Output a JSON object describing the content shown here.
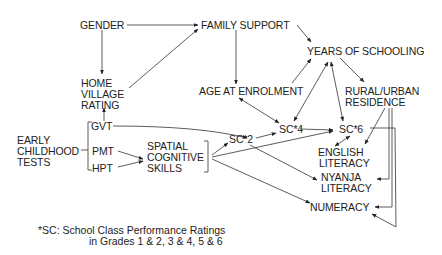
{
  "diagram": {
    "nodes": {
      "gender": [
        "GENDER"
      ],
      "family_support": [
        "FAMILY SUPPORT"
      ],
      "years_of_schooling": [
        "YEARS OF SCHOOLING"
      ],
      "home_village_rating": [
        "HOME",
        "VILLAGE",
        "RATING"
      ],
      "age_at_enrolment": [
        "AGE AT ENROLMENT"
      ],
      "rural_urban_residence": [
        "RURAL/URBAN",
        "RESIDENCE"
      ],
      "early_childhood_tests": [
        "EARLY",
        "CHILDHOOD",
        "TESTS"
      ],
      "gvt": [
        "GVT"
      ],
      "pmt": [
        "PMT"
      ],
      "hpt": [
        "HPT"
      ],
      "spatial_cognitive_skills": [
        "SPATIAL",
        "COGNITIVE",
        "SKILLS"
      ],
      "sc2": [
        "SC*2"
      ],
      "sc4": [
        "SC*4"
      ],
      "sc6": [
        "SC*6"
      ],
      "english_literacy": [
        "ENGLISH",
        "LITERACY"
      ],
      "nyanja_literacy": [
        "NYANJA",
        "LITERACY"
      ],
      "numeracy": [
        "NUMERACY"
      ]
    },
    "edges": [
      {
        "from": "gender",
        "to": "family_support",
        "type": "directed"
      },
      {
        "from": "gender",
        "to": "home_village_rating",
        "type": "directed"
      },
      {
        "from": "home_village_rating",
        "to": "family_support",
        "type": "directed"
      },
      {
        "from": "gvt",
        "to": "home_village_rating",
        "type": "directed"
      },
      {
        "from": "family_support",
        "to": "years_of_schooling",
        "type": "directed"
      },
      {
        "from": "family_support",
        "to": "age_at_enrolment",
        "type": "directed"
      },
      {
        "from": "age_at_enrolment",
        "to": "years_of_schooling",
        "type": "directed"
      },
      {
        "from": "age_at_enrolment",
        "to": "sc4",
        "type": "bidirectional"
      },
      {
        "from": "years_of_schooling",
        "to": "sc4",
        "type": "bidirectional"
      },
      {
        "from": "years_of_schooling",
        "to": "sc6",
        "type": "bidirectional"
      },
      {
        "from": "years_of_schooling",
        "to": "rural_urban_residence",
        "type": "directed"
      },
      {
        "from": "gvt",
        "to": "sc2",
        "type": "directed"
      },
      {
        "from": "pmt",
        "to": "spatial_cognitive_skills",
        "type": "directed"
      },
      {
        "from": "hpt",
        "to": "spatial_cognitive_skills",
        "type": "directed"
      },
      {
        "from": "spatial_cognitive_skills",
        "to": "sc2",
        "type": "directed"
      },
      {
        "from": "spatial_cognitive_skills",
        "to": "sc6",
        "type": "directed"
      },
      {
        "from": "spatial_cognitive_skills",
        "to": "numeracy",
        "type": "directed"
      },
      {
        "from": "sc2",
        "to": "sc4",
        "type": "directed"
      },
      {
        "from": "sc2",
        "to": "nyanja_literacy",
        "type": "directed"
      },
      {
        "from": "sc4",
        "to": "sc6",
        "type": "directed"
      },
      {
        "from": "sc6",
        "to": "english_literacy",
        "type": "bidirectional"
      },
      {
        "from": "sc6",
        "to": "numeracy",
        "type": "directed"
      },
      {
        "from": "rural_urban_residence",
        "to": "english_literacy",
        "type": "directed"
      },
      {
        "from": "rural_urban_residence",
        "to": "nyanja_literacy",
        "type": "directed"
      },
      {
        "from": "rural_urban_residence",
        "to": "numeracy",
        "type": "directed"
      }
    ],
    "footnote": [
      "*SC: School Class Performance Ratings",
      "in Grades 1 & 2, 3 & 4, 5 & 6"
    ]
  }
}
